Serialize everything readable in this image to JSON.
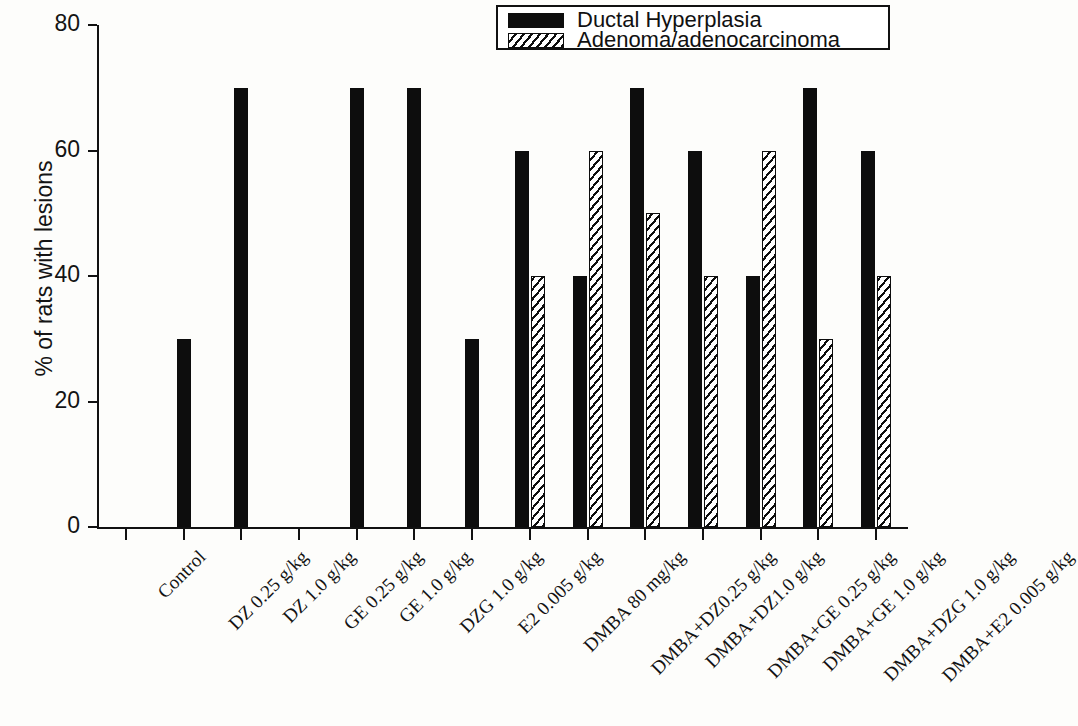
{
  "figure": {
    "top_cut_text": "",
    "background_color": "#fdfdfb",
    "ink_color": "#0d0d0d"
  },
  "legend": {
    "position": "top-right",
    "entries": [
      {
        "label": "Ductal Hyperplasia",
        "swatch": "solid-black-swatch"
      },
      {
        "label": "Adenoma/adenocarcinoma",
        "swatch": "hatched-swatch"
      }
    ]
  },
  "chart_data": {
    "type": "bar",
    "title": "",
    "xlabel": "",
    "ylabel": "% of rats with lesions",
    "ylim": [
      0,
      80
    ],
    "yticks": [
      0,
      20,
      40,
      60,
      80
    ],
    "ytick_labels": [
      "0",
      "20",
      "40",
      "60",
      "80"
    ],
    "grid": false,
    "legend_position": "upper right",
    "categories": [
      "Control",
      "DZ 0.25 g/kg",
      "DZ 1.0 g/kg",
      "GE 0.25 g/kg",
      "GE 1.0 g/kg",
      "DZG 1.0 g/kg",
      "E2 0.005 g/kg",
      "DMBA 80 mg/kg",
      "DMBA+DZ0.25 g/kg",
      "DMBA+DZ1.0 g/kg",
      "DMBA+GE 0.25 g/kg",
      "DMBA+GE 1.0 g/kg",
      "DMBA+DZG 1.0 g/kg",
      "DMBA+E2 0.005 g/kg"
    ],
    "series": [
      {
        "name": "Ductal Hyperplasia",
        "pattern": "solid",
        "values": [
          0,
          30,
          70,
          0,
          70,
          70,
          30,
          60,
          40,
          70,
          60,
          40,
          70,
          60
        ]
      },
      {
        "name": "Adenoma/adenocarcinoma",
        "pattern": "hatched",
        "values": [
          0,
          0,
          0,
          0,
          0,
          0,
          0,
          40,
          60,
          50,
          40,
          60,
          30,
          40
        ]
      }
    ]
  }
}
